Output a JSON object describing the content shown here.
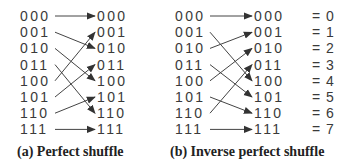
{
  "panels": [
    {
      "id": "a",
      "caption": "(a) Perfect shuffle",
      "inputs": [
        "000",
        "001",
        "010",
        "011",
        "100",
        "101",
        "110",
        "111"
      ],
      "outputs": [
        "000",
        "001",
        "010",
        "011",
        "100",
        "101",
        "110",
        "111"
      ],
      "mapping": [
        0,
        2,
        4,
        6,
        1,
        3,
        5,
        7
      ]
    },
    {
      "id": "b",
      "caption": "(b) Inverse perfect shuffle",
      "inputs": [
        "000",
        "001",
        "010",
        "011",
        "100",
        "101",
        "110",
        "111"
      ],
      "outputs": [
        "000",
        "001",
        "010",
        "011",
        "100",
        "101",
        "110",
        "111"
      ],
      "mapping": [
        0,
        4,
        1,
        5,
        2,
        6,
        3,
        7
      ],
      "decimal_labels": [
        "= 0",
        "= 1",
        "= 2",
        "= 3",
        "= 4",
        "= 5",
        "= 6",
        "= 7"
      ]
    }
  ],
  "colors": {
    "line": "#444444",
    "text": "#3a3a3a"
  }
}
